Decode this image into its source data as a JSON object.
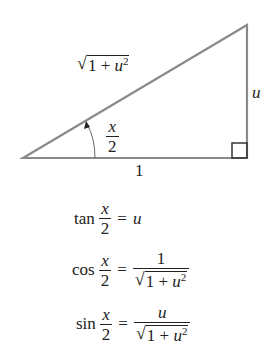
{
  "triangle": {
    "hypotenuse_label": {
      "radicand_one": "1",
      "plus": "+",
      "var": "u",
      "exp": "2",
      "radical": "√"
    },
    "opposite_label": "u",
    "adjacent_label": "1",
    "angle_label": {
      "numerator": "x",
      "denominator": "2"
    },
    "line_color": "#888888",
    "right_angle_color": "#333333"
  },
  "equations": [
    {
      "fn": "tan",
      "arg_num": "x",
      "arg_den": "2",
      "eq": "=",
      "rhs": "u"
    },
    {
      "fn": "cos",
      "arg_num": "x",
      "arg_den": "2",
      "eq": "=",
      "rhs_num": "1",
      "rhs_den": {
        "radical": "√",
        "one": "1",
        "plus": "+",
        "var": "u",
        "exp": "2"
      }
    },
    {
      "fn": "sin",
      "arg_num": "x",
      "arg_den": "2",
      "eq": "=",
      "rhs_num": "u",
      "rhs_den": {
        "radical": "√",
        "one": "1",
        "plus": "+",
        "var": "u",
        "exp": "2"
      }
    }
  ]
}
